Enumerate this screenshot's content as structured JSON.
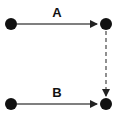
{
  "diagram": {
    "nodes": [
      {
        "id": "top-left"
      },
      {
        "id": "top-right"
      },
      {
        "id": "bottom-left"
      },
      {
        "id": "bottom-right"
      }
    ],
    "edges": [
      {
        "from": "top-left",
        "to": "top-right",
        "label": "A",
        "style": "solid"
      },
      {
        "from": "bottom-left",
        "to": "bottom-right",
        "label": "B",
        "style": "solid"
      },
      {
        "from": "top-right",
        "to": "bottom-right",
        "label": "",
        "style": "dashed"
      }
    ],
    "colors": {
      "node": "#111111",
      "edge": "#555555"
    }
  }
}
